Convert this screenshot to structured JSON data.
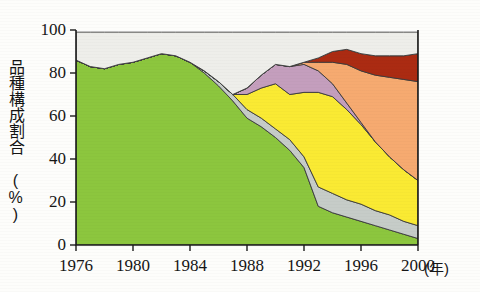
{
  "chart_data": {
    "type": "area",
    "title": "",
    "subtitle": "",
    "xlabel": "年",
    "ylabel": "品種構成割合 (%)",
    "ylabel_main": "品種構成割合",
    "ylabel_unit": "(%)",
    "xaxis_unit": "(年)",
    "stacked": true,
    "stack_order": "bottom-to-top",
    "grid": false,
    "legend": "none",
    "xlim": [
      1976,
      2000
    ],
    "ylim": [
      0,
      100
    ],
    "ytick_labels": [
      "100",
      "80",
      "60",
      "40",
      "20",
      "0"
    ],
    "yticks": [
      100,
      80,
      60,
      40,
      20,
      0
    ],
    "xtick_labels": [
      "1976",
      "1980",
      "1984",
      "1988",
      "1992",
      "1996",
      "2000"
    ],
    "xticks": [
      1976,
      1980,
      1984,
      1988,
      1992,
      1996,
      2000
    ],
    "x": [
      1976,
      1977,
      1978,
      1979,
      1980,
      1981,
      1982,
      1983,
      1984,
      1985,
      1986,
      1987,
      1988,
      1989,
      1990,
      1991,
      1992,
      1993,
      1994,
      1995,
      1996,
      1997,
      1998,
      1999,
      2000
    ],
    "series": [
      {
        "name": "green-variety",
        "color": "#8cc63e",
        "values": [
          86,
          83,
          82,
          84,
          85,
          87,
          89,
          88,
          85,
          80,
          74,
          67,
          59,
          55,
          50,
          44,
          36,
          18,
          15,
          13,
          11,
          9,
          7,
          5,
          3
        ]
      },
      {
        "name": "gray-variety",
        "color": "#c6ccc8",
        "values": [
          0,
          0,
          0,
          0,
          0,
          0,
          0,
          0,
          0,
          1,
          2,
          3,
          4,
          4,
          4,
          5,
          5,
          9,
          9,
          8,
          8,
          7,
          7,
          6,
          6
        ]
      },
      {
        "name": "yellow-variety",
        "color": "#faea33",
        "values": [
          0,
          0,
          0,
          0,
          0,
          0,
          0,
          0,
          0,
          0,
          0,
          0,
          7,
          14,
          21,
          21,
          30,
          44,
          45,
          42,
          37,
          32,
          27,
          24,
          21
        ]
      },
      {
        "name": "purple-variety",
        "color": "#c49ebd",
        "values": [
          0,
          0,
          0,
          0,
          0,
          0,
          0,
          0,
          0,
          0,
          0,
          0,
          3,
          6,
          9,
          13,
          13,
          10,
          6,
          3,
          1,
          0,
          0,
          0,
          0
        ]
      },
      {
        "name": "orange-variety",
        "color": "#f6aa70",
        "values": [
          0,
          0,
          0,
          0,
          0,
          0,
          0,
          0,
          0,
          0,
          0,
          0,
          0,
          0,
          0,
          0,
          1,
          4,
          10,
          18,
          24,
          31,
          37,
          42,
          46
        ]
      },
      {
        "name": "darkred-variety",
        "color": "#ab2b12",
        "values": [
          0,
          0,
          0,
          0,
          0,
          0,
          0,
          0,
          0,
          0,
          0,
          0,
          0,
          0,
          0,
          0,
          0,
          2,
          5,
          7,
          8,
          9,
          10,
          11,
          13
        ]
      },
      {
        "name": "others",
        "color": "#eeeeea",
        "values": [
          13,
          16,
          17,
          15,
          14,
          12,
          10,
          11,
          14,
          18,
          23,
          29,
          26,
          20,
          15,
          16,
          14,
          12,
          9,
          8,
          10,
          11,
          11,
          11,
          10
        ]
      }
    ],
    "colors": {
      "green": "#8cc63e",
      "gray": "#c6ccc8",
      "yellow": "#faea33",
      "purple": "#c49ebd",
      "orange": "#f6aa70",
      "darkred": "#ab2b12",
      "others": "#eeeeea",
      "axis": "#1b1b1b",
      "background": "#fdfdfb"
    }
  }
}
